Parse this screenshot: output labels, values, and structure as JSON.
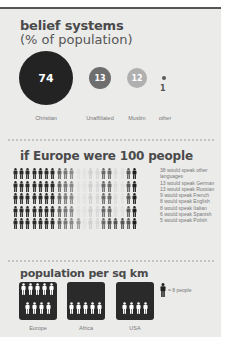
{
  "section1": {
    "title": "belief systems",
    "subtitle": "(% of population)",
    "items": [
      {
        "label": "Christian",
        "value": "74",
        "color": "#232323"
      },
      {
        "label": "Unaffiliated",
        "value": "13",
        "color": "#6e6e6e"
      },
      {
        "label": "Muslim",
        "value": "12",
        "color": "#a9a9a9"
      },
      {
        "label": "other",
        "value": "1",
        "color": "#5a5a5a"
      }
    ]
  },
  "section2": {
    "title": "if Europe were 100 people",
    "legend": [
      "38 would speak other",
      "languages",
      "13 would speak German",
      "13 would speak Russian",
      "9 would speak French",
      "8 would speak English",
      "8 would speak Italian",
      "6 would speak Spanish",
      "5 would speak Polish"
    ]
  },
  "section3": {
    "title": "population per sq km",
    "key": "= 8 people",
    "regions": [
      {
        "label": "Europe",
        "icons": 9
      },
      {
        "label": "Africa",
        "icons": 5
      },
      {
        "label": "USA",
        "icons": 4
      }
    ]
  },
  "chart_data": [
    {
      "type": "bubble",
      "title": "belief systems (% of population)",
      "categories": [
        "Christian",
        "Unaffiliated",
        "Muslim",
        "other"
      ],
      "values": [
        74,
        13,
        12,
        1
      ]
    },
    {
      "type": "pictogram",
      "title": "if Europe were 100 people",
      "categories": [
        "other languages",
        "German",
        "Russian",
        "French",
        "English",
        "Italian",
        "Spanish",
        "Polish"
      ],
      "values": [
        38,
        13,
        13,
        9,
        8,
        8,
        6,
        5
      ],
      "grid": {
        "rows": 5,
        "cols": 20
      }
    },
    {
      "type": "pictogram",
      "title": "population per sq km",
      "unit": "1 icon = 8 people",
      "categories": [
        "Europe",
        "Africa",
        "USA"
      ],
      "icons": [
        9,
        5,
        4
      ],
      "values": [
        72,
        40,
        32
      ]
    }
  ]
}
